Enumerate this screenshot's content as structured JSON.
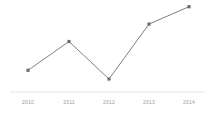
{
  "chart": {
    "background_color": "#ffffff",
    "line_color": "#808080",
    "marker_color": "#6e6e6e",
    "axis_color": "#e8e8e8",
    "tick_label_color": "#9a9a9a",
    "axis_baseline_y": 92,
    "plot_top_y": 5,
    "axis_line_x_start": 10,
    "axis_line_x_end": 205
  },
  "chart_data": {
    "type": "line",
    "title": "",
    "subtitle": "",
    "xlabel": "",
    "ylabel": "",
    "grid": false,
    "legend": false,
    "legend_position": "none",
    "categories": [
      "2010",
      "2011",
      "2012",
      "2013",
      "2014"
    ],
    "x": [
      2010,
      2011,
      2012,
      2013,
      2014
    ],
    "values": [
      25,
      58,
      15,
      78,
      98
    ],
    "series": [
      {
        "name": "",
        "values": [
          25,
          58,
          15,
          78,
          98
        ],
        "color": "#808080",
        "marker": "square"
      }
    ],
    "ylim": [
      0,
      100
    ],
    "xlim": [
      2010,
      2014
    ],
    "ytick_labels": [],
    "xtick_labels": [
      "2010",
      "2011",
      "2012",
      "2013",
      "2014"
    ],
    "annotations": [],
    "point_pixels": [
      {
        "label": "2010",
        "x": 28,
        "y": 70
      },
      {
        "label": "2011",
        "x": 69,
        "y": 42
      },
      {
        "label": "2012",
        "x": 109,
        "y": 79
      },
      {
        "label": "2013",
        "x": 149,
        "y": 24
      },
      {
        "label": "2014",
        "x": 189,
        "y": 6
      }
    ]
  }
}
